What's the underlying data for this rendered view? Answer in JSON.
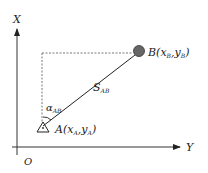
{
  "diagram": {
    "axes": {
      "vertical_label": "X",
      "horizontal_label": "Y",
      "origin_label": "O"
    },
    "points": {
      "A": {
        "name": "A",
        "open": "(",
        "x": "x",
        "x_sub": "A",
        "sep": ",",
        "y": "y",
        "y_sub": "A",
        "close": ")"
      },
      "B": {
        "name": "B",
        "open": "(",
        "x": "x",
        "x_sub": "B",
        "sep": ",",
        "y": "y",
        "y_sub": "B",
        "close": ")"
      }
    },
    "distance": {
      "symbol": "S",
      "sub": "AB"
    },
    "azimuth": {
      "symbol": "α",
      "sub": "AB"
    },
    "colors": {
      "line": "#222222",
      "dashed": "#555555",
      "point_b": "#555555",
      "background": "#ffffff"
    }
  }
}
